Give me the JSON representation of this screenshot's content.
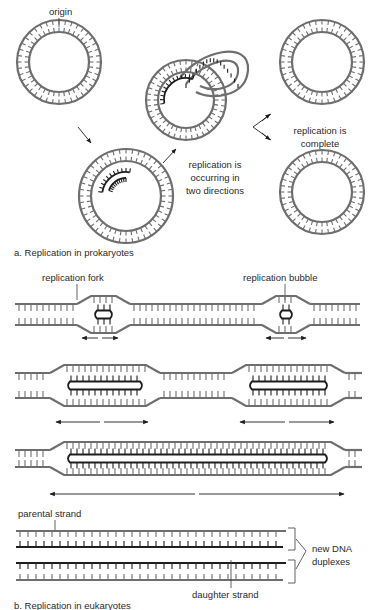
{
  "figure": {
    "panel_a": {
      "caption": "a. Replication in prokaryotes",
      "labels": {
        "origin": "origin",
        "occurring_line1": "replication is",
        "occurring_line2": "occurring in",
        "occurring_line3": "two directions",
        "complete_line1": "replication is",
        "complete_line2": "complete"
      }
    },
    "panel_b": {
      "caption": "b. Replication in eukaryotes",
      "labels": {
        "fork": "replication fork",
        "bubble": "replication bubble",
        "parental": "parental strand",
        "daughter": "daughter strand",
        "duplex_line1": "new DNA",
        "duplex_line2": "duplexes"
      }
    },
    "colors": {
      "parental_strand": "#6e6e6e",
      "daughter_strand": "#1e1e1e",
      "background": "#ffffff"
    }
  }
}
